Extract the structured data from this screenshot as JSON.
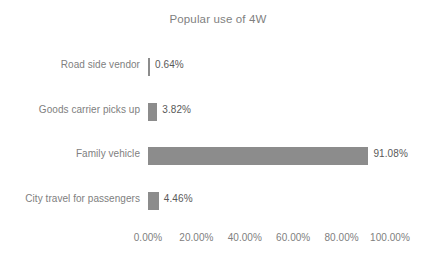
{
  "chart_data": {
    "type": "bar",
    "orientation": "horizontal",
    "title": "Popular use of 4W",
    "xlabel": "",
    "ylabel": "",
    "categories": [
      "Road side vendor",
      "Goods carrier picks up",
      "Family vehicle",
      "City travel for passengers"
    ],
    "values": [
      0.64,
      3.82,
      91.08,
      4.46
    ],
    "data_labels": [
      "0.64%",
      "3.82%",
      "91.08%",
      "4.46%"
    ],
    "xlim": [
      0,
      100
    ],
    "xticks": [
      0,
      20,
      40,
      60,
      80,
      100
    ],
    "xtick_labels": [
      "0.00%",
      "20.00%",
      "40.00%",
      "60.00%",
      "80.00%",
      "100.00%"
    ],
    "grid": false,
    "legend": false,
    "legend_position": "none",
    "series": [
      {
        "name": "Popular use of 4W",
        "values": [
          0.64,
          3.82,
          91.08,
          4.46
        ],
        "color": "#8c8c8c"
      }
    ]
  },
  "colors": {
    "bar": "#8c8c8c",
    "title_text": "#7f7f7f",
    "axis_text": "#808080",
    "value_text": "#595959",
    "background": "#ffffff"
  }
}
